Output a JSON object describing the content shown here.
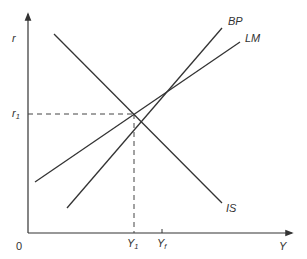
{
  "diagram": {
    "type": "IS-LM-BP macroeconomic diagram",
    "axes": {
      "y_label": "r",
      "x_label": "Y",
      "origin_label": "0"
    },
    "curves": [
      {
        "name": "IS",
        "label": "IS",
        "slope": "downward"
      },
      {
        "name": "LM",
        "label": "LM",
        "slope": "upward"
      },
      {
        "name": "BP",
        "label": "BP",
        "slope": "upward, steeper than LM"
      }
    ],
    "markers": {
      "r1": {
        "label": "r",
        "subscript": "1"
      },
      "y1": {
        "label": "Y",
        "subscript": "1"
      },
      "yf": {
        "label": "Y",
        "subscript": "f"
      }
    },
    "colors": {
      "line": "#333333",
      "axis": "#333333",
      "dashed": "#444444"
    }
  }
}
